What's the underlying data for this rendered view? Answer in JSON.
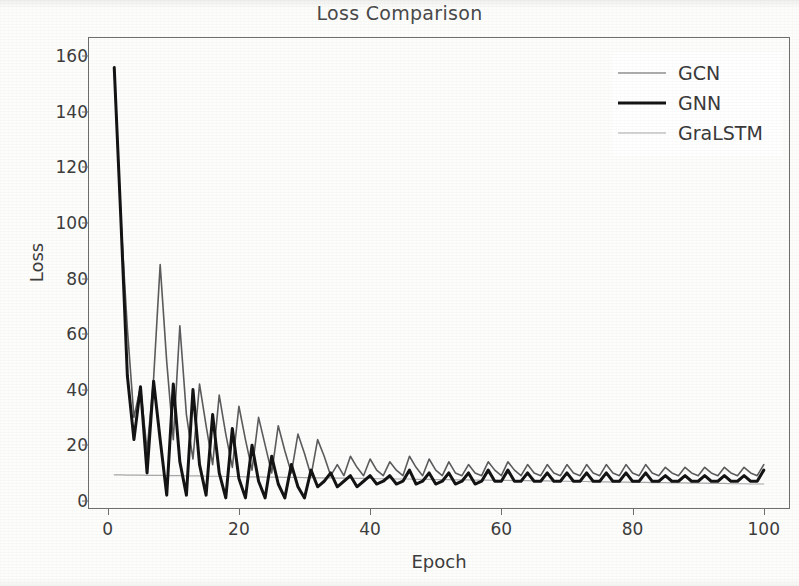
{
  "chart_data": {
    "type": "line",
    "title": "Loss Comparison",
    "xlabel": "Epoch",
    "ylabel": "Loss",
    "xlim": [
      -3,
      104
    ],
    "ylim": [
      -3,
      167
    ],
    "xticks": [
      0,
      20,
      40,
      60,
      80,
      100
    ],
    "yticks": [
      0,
      20,
      40,
      60,
      80,
      100,
      120,
      140,
      160
    ],
    "grid": false,
    "legend_position": "upper right",
    "colors": {
      "GCN": "#5c5c5c",
      "GNN": "#141414",
      "GraLSTM": "#a8a8a8",
      "axis": "#6f6f6f",
      "text": "#3d3d3d",
      "title": "#4a4a4a",
      "background": "#fdfdfc"
    },
    "x": [
      1,
      2,
      3,
      4,
      5,
      6,
      7,
      8,
      9,
      10,
      11,
      12,
      13,
      14,
      15,
      16,
      17,
      18,
      19,
      20,
      21,
      22,
      23,
      24,
      25,
      26,
      27,
      28,
      29,
      30,
      31,
      32,
      33,
      34,
      35,
      36,
      37,
      38,
      39,
      40,
      41,
      42,
      43,
      44,
      45,
      46,
      47,
      48,
      49,
      50,
      51,
      52,
      53,
      54,
      55,
      56,
      57,
      58,
      59,
      60,
      61,
      62,
      63,
      64,
      65,
      66,
      67,
      68,
      69,
      70,
      71,
      72,
      73,
      74,
      75,
      76,
      77,
      78,
      79,
      80,
      81,
      82,
      83,
      84,
      85,
      86,
      87,
      88,
      89,
      90,
      91,
      92,
      93,
      94,
      95,
      96,
      97,
      98,
      99,
      100
    ],
    "series": [
      {
        "name": "GCN",
        "color": "#5c5c5c",
        "linewidth": 1.6,
        "values": [
          156,
          102,
          62,
          30,
          41,
          18,
          44,
          85,
          50,
          22,
          63,
          31,
          15,
          42,
          27,
          13,
          38,
          24,
          12,
          34,
          22,
          11,
          30,
          20,
          10,
          27,
          18,
          10,
          24,
          17,
          9,
          22,
          16,
          9,
          13,
          9,
          16,
          12,
          9,
          15,
          11,
          9,
          14,
          11,
          9,
          16,
          12,
          9,
          15,
          11,
          9,
          14,
          10,
          9,
          13,
          10,
          9,
          14,
          11,
          9,
          14,
          11,
          9,
          13,
          10,
          9,
          13,
          10,
          9,
          13,
          10,
          9,
          13,
          10,
          9,
          13,
          10,
          9,
          13,
          10,
          9,
          13,
          10,
          9,
          12,
          10,
          9,
          12,
          10,
          9,
          12,
          10,
          9,
          12,
          10,
          9,
          12,
          10,
          9,
          13
        ]
      },
      {
        "name": "GNN",
        "color": "#141414",
        "linewidth": 3.0,
        "values": [
          156,
          102,
          45,
          22,
          41,
          10,
          43,
          22,
          2,
          42,
          14,
          2,
          40,
          13,
          2,
          31,
          10,
          1,
          26,
          8,
          1,
          20,
          7,
          1,
          16,
          6,
          1,
          13,
          5,
          1,
          11,
          5,
          7,
          10,
          5,
          7,
          9,
          5,
          7,
          9,
          6,
          7,
          9,
          6,
          7,
          11,
          6,
          7,
          10,
          6,
          7,
          10,
          6,
          7,
          10,
          6,
          7,
          11,
          7,
          7,
          11,
          7,
          7,
          10,
          7,
          7,
          10,
          7,
          7,
          10,
          7,
          7,
          10,
          7,
          7,
          10,
          7,
          7,
          10,
          7,
          7,
          10,
          7,
          7,
          9,
          7,
          7,
          9,
          7,
          7,
          9,
          7,
          7,
          9,
          7,
          7,
          9,
          7,
          7,
          11
        ]
      },
      {
        "name": "GraLSTM",
        "color": "#a8a8a8",
        "linewidth": 1.2,
        "values": [
          9.3,
          9.3,
          9.2,
          9.2,
          9.2,
          9.1,
          9.1,
          9.1,
          9.0,
          9.0,
          9.0,
          8.9,
          8.9,
          8.9,
          8.8,
          8.8,
          8.8,
          8.7,
          8.7,
          8.7,
          8.6,
          8.6,
          8.6,
          8.5,
          8.5,
          8.5,
          8.4,
          8.4,
          8.4,
          8.3,
          8.3,
          8.2,
          8.2,
          8.2,
          8.1,
          8.1,
          8.1,
          8.0,
          8.0,
          8.0,
          7.9,
          7.9,
          7.9,
          7.8,
          7.8,
          7.8,
          7.7,
          7.7,
          7.7,
          7.6,
          7.6,
          7.6,
          7.5,
          7.5,
          7.5,
          7.4,
          7.4,
          7.4,
          7.3,
          7.3,
          7.3,
          7.2,
          7.2,
          7.2,
          7.1,
          7.1,
          7.1,
          7.0,
          7.0,
          7.0,
          6.9,
          6.9,
          6.9,
          6.8,
          6.8,
          6.8,
          6.7,
          6.7,
          6.7,
          6.6,
          6.6,
          6.6,
          6.5,
          6.5,
          6.5,
          6.4,
          6.4,
          6.4,
          6.3,
          6.3,
          6.3,
          6.2,
          6.2,
          6.2,
          6.1,
          6.1,
          6.1,
          6.0,
          6.0,
          6.0
        ]
      }
    ]
  },
  "legend": {
    "items": [
      {
        "label": "GCN"
      },
      {
        "label": "GNN"
      },
      {
        "label": "GraLSTM"
      }
    ]
  }
}
